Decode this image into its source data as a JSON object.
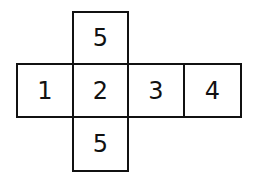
{
  "diagram": {
    "type": "cube-net",
    "faces": [
      {
        "id": "top",
        "label": "5"
      },
      {
        "id": "left",
        "label": "1"
      },
      {
        "id": "center",
        "label": "2"
      },
      {
        "id": "right",
        "label": "3"
      },
      {
        "id": "far-right",
        "label": "4"
      },
      {
        "id": "bottom",
        "label": "5"
      }
    ]
  }
}
